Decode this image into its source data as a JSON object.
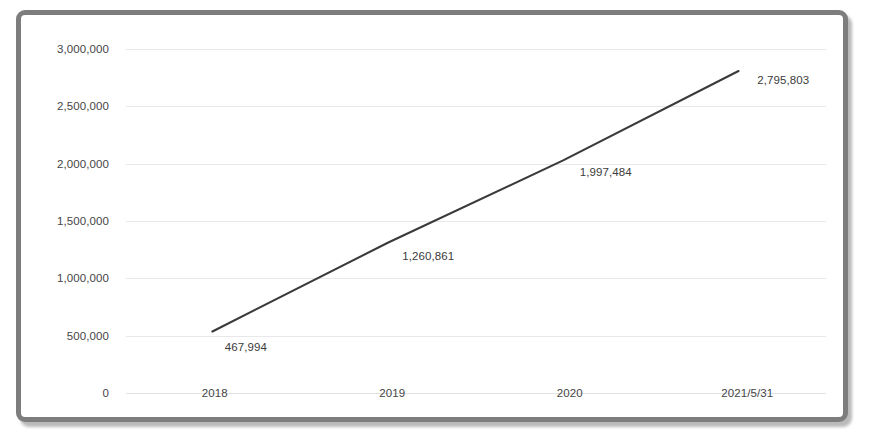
{
  "chart_data": {
    "type": "line",
    "title": "",
    "subtitle": "",
    "xlabel": "",
    "ylabel": "",
    "categories": [
      "2018",
      "2019",
      "2020",
      "2021/5/31"
    ],
    "values": [
      467994,
      1260861,
      1997484,
      2795803
    ],
    "data_labels": [
      "467,994",
      "1,260,861",
      "1,997,484",
      "2,795,803"
    ],
    "ylim": [
      0,
      3000000
    ],
    "ytick_values": [
      0,
      500000,
      1000000,
      1500000,
      2000000,
      2500000,
      3000000
    ],
    "ytick_labels": [
      "0",
      "500,000",
      "1,000,000",
      "1,500,000",
      "2,000,000",
      "2,500,000",
      "3,000,000"
    ],
    "grid": true,
    "legend": false,
    "legend_position": "none",
    "series": [
      {
        "name": "",
        "values": [
          467994,
          1260861,
          1997484,
          2795803
        ]
      }
    ]
  },
  "style": {
    "line_color": "#3a3a3a",
    "grid_color": "#e8e8ea",
    "tick_text_color": "#454545",
    "data_label_color": "#3b3b3b",
    "frame_color": "#7d7d7d",
    "plot_background": "#ffffff"
  }
}
